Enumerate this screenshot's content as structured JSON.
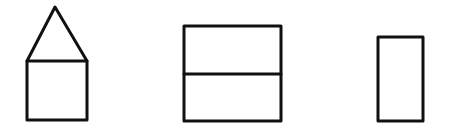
{
  "diagram": {
    "stroke_color": "#111111",
    "stroke_width": 3,
    "background": "#ffffff",
    "shapes": [
      {
        "name": "house",
        "parts": [
          "triangle-roof",
          "square-body"
        ],
        "roof": {
          "apex": [
            55,
            7
          ],
          "base_left": [
            27,
            61
          ],
          "base_right": [
            87,
            61
          ]
        },
        "body": {
          "x": 27,
          "y": 61,
          "width": 60,
          "height": 59
        }
      },
      {
        "name": "split-rectangle",
        "parts": [
          "outer-rectangle",
          "horizontal-divider"
        ],
        "outer": {
          "x": 184,
          "y": 26,
          "width": 97,
          "height": 95
        },
        "divider_y": 74
      },
      {
        "name": "tall-rectangle",
        "parts": [
          "rectangle"
        ],
        "rect": {
          "x": 378,
          "y": 37,
          "width": 45,
          "height": 84
        }
      }
    ]
  }
}
